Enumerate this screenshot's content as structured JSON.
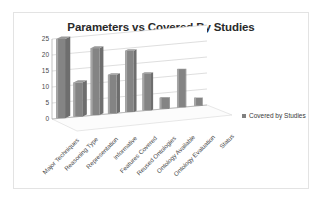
{
  "chart": {
    "title": "Parameters vs Covered By Studies",
    "legend_label": "Covered by Studies",
    "legend_swatch_icon": "square-marker-icon"
  },
  "chart_data": {
    "type": "bar",
    "title": "Parameters vs Covered By Studies",
    "xlabel": "",
    "ylabel": "",
    "ylim": [
      0,
      25
    ],
    "yticks": [
      0,
      5,
      10,
      15,
      20,
      25
    ],
    "grid": true,
    "legend_position": "right",
    "style": "3d-column",
    "bar_color": "#808080",
    "categories": [
      "Major Techniques",
      "Reasoning Type",
      "Representation",
      "Informative",
      "Features Covered",
      "Reused Ontologies",
      "Ontology Available",
      "Ontology Evaluation",
      "Status"
    ],
    "series": [
      {
        "name": "Covered by Studies",
        "values": [
          25,
          11,
          22,
          13,
          21,
          13,
          4,
          14,
          3
        ]
      }
    ]
  }
}
